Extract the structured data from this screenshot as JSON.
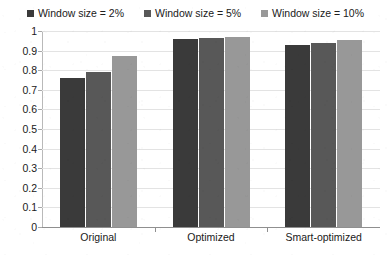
{
  "chart_data": {
    "type": "bar",
    "title": "",
    "xlabel": "",
    "ylabel": "",
    "categories": [
      "Original",
      "Optimized",
      "Smart-optimized"
    ],
    "series": [
      {
        "name": "Window size = 2%",
        "color": "#3a3a3a",
        "values": [
          0.76,
          0.96,
          0.93
        ]
      },
      {
        "name": "Window size = 5%",
        "color": "#585858",
        "values": [
          0.79,
          0.965,
          0.94
        ]
      },
      {
        "name": "Window size = 10%",
        "color": "#989898",
        "values": [
          0.87,
          0.97,
          0.955
        ]
      }
    ],
    "ylim": [
      0,
      1
    ],
    "yticks": [
      "0",
      "0.1",
      "0.2",
      "0.3",
      "0.4",
      "0.5",
      "0.6",
      "0.7",
      "0.8",
      "0.9",
      "1"
    ],
    "grid": true,
    "legend_position": "top"
  }
}
